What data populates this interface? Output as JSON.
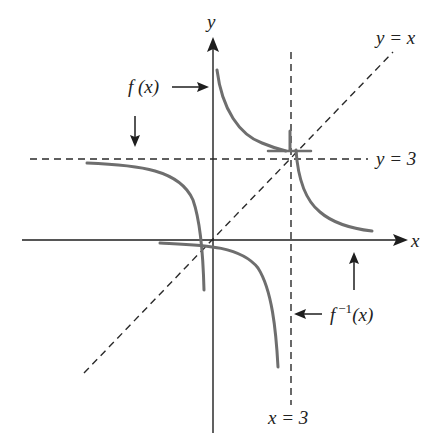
{
  "diagram": {
    "colors": {
      "axis": "#1e1e1e",
      "curve": "#6e6e6e",
      "dashed": "#2a2a2a",
      "background": "#ffffff"
    },
    "axes": {
      "x_label": "x",
      "y_label": "y"
    },
    "asymptotes": [
      {
        "label": "y = 3",
        "orientation": "horizontal"
      },
      {
        "label": "x = 3",
        "orientation": "vertical"
      }
    ],
    "reference_line": {
      "label": "y = x"
    },
    "curve_labels": {
      "f": "f (x)",
      "f_inverse_base": "f",
      "f_inverse_sup": "−1",
      "f_inverse_arg": "(x)"
    }
  }
}
